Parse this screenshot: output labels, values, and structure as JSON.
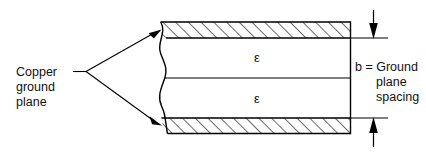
{
  "figure": {
    "background_color": "#ffffff",
    "line_color": "#000000",
    "text_color": "#111111"
  },
  "labels": {
    "left_callout": {
      "name": "copper-ground-plane-label",
      "lines": [
        "Copper",
        "ground",
        "plane"
      ]
    },
    "right_dimension": {
      "name": "ground-plane-spacing-label",
      "lines": [
        "b = Ground",
        "plane",
        "spacing"
      ],
      "symbol": "b"
    }
  },
  "regions": {
    "upper_dielectric": {
      "name": "upper-dielectric-region",
      "symbol": "ε"
    },
    "lower_dielectric": {
      "name": "lower-dielectric-region",
      "symbol": "ε"
    },
    "upper_conductor": {
      "name": "upper-copper-ground-plane",
      "fill": "hatched"
    },
    "lower_conductor": {
      "name": "lower-copper-ground-plane",
      "fill": "hatched"
    }
  },
  "annotations": {
    "break_line": "wavy-break-line",
    "leader_top": "leader-arrow-to-upper-plane",
    "leader_bottom": "leader-arrow-to-lower-plane",
    "dimension_arrow_top": "dimension-arrow-down",
    "dimension_arrow_bottom": "dimension-arrow-up",
    "extension_line_top": "extension-line-upper",
    "extension_line_bottom": "extension-line-lower"
  }
}
